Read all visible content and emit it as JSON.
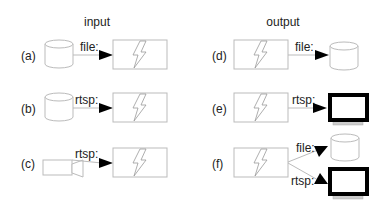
{
  "headers": {
    "input": "input",
    "output": "output"
  },
  "rows": {
    "a": {
      "tag": "(a)",
      "protocol": "file:",
      "source": "storage-cylinder",
      "target": "process-box"
    },
    "b": {
      "tag": "(b)",
      "protocol": "rtsp:",
      "source": "storage-cylinder",
      "target": "process-box"
    },
    "c": {
      "tag": "(c)",
      "protocol": "rtsp:",
      "source": "camera",
      "target": "process-box"
    },
    "d": {
      "tag": "(d)",
      "protocol": "file:",
      "source": "process-box",
      "target": "storage-cylinder"
    },
    "e": {
      "tag": "(e)",
      "protocol": "rtsp:",
      "source": "process-box",
      "target": "monitor"
    },
    "f": {
      "tag": "(f)",
      "protocol_file": "file:",
      "protocol_rtsp": "rtsp:",
      "source": "process-box",
      "targets": [
        "storage-cylinder",
        "monitor"
      ]
    }
  },
  "colors": {
    "outline": "#bbbbbb",
    "arrow": "#000000",
    "monitor_frame": "#000000",
    "monitor_stand": "#cccccc"
  }
}
